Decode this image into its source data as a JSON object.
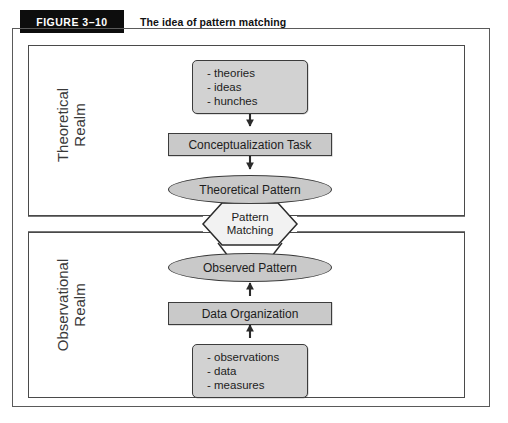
{
  "figure": {
    "banner_label": "FIGURE 3–10",
    "title": "The idea of pattern matching"
  },
  "realms": {
    "theoretical": {
      "label": "Theoretical\nRealm"
    },
    "observational": {
      "label": "Observational\nRealm"
    }
  },
  "nodes": {
    "theory_inputs": {
      "items": [
        "- theories",
        "- ideas",
        "- hunches"
      ]
    },
    "conceptualization_task": {
      "label": "Conceptualization Task"
    },
    "theoretical_pattern": {
      "label": "Theoretical Pattern"
    },
    "pattern_matching": {
      "line1": "Pattern",
      "line2": "Matching"
    },
    "observed_pattern": {
      "label": "Observed Pattern"
    },
    "data_organization": {
      "label": "Data Organization"
    },
    "observation_inputs": {
      "items": [
        "- observations",
        "- data",
        "- measures"
      ]
    }
  },
  "colors": {
    "banner_bg": "#0d0d0d",
    "banner_text": "#ffffff",
    "node_fill": "#c9c9c9",
    "node_stroke": "#3c3c3c",
    "frame_stroke": "#5a5a5a",
    "page_bg": "#ffffff"
  }
}
